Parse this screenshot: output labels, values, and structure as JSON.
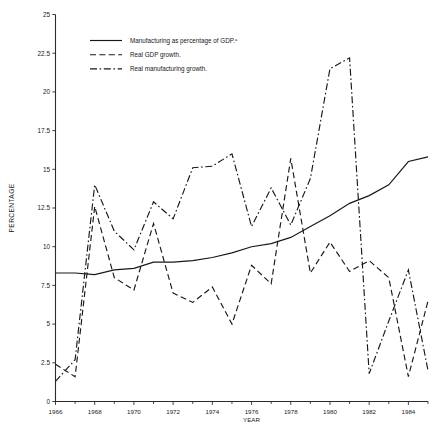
{
  "chart_data": {
    "type": "line",
    "title": "",
    "xlabel": "YEAR",
    "ylabel": "PERCENTAGE",
    "xlim": [
      1966,
      1985
    ],
    "ylim": [
      0,
      25
    ],
    "ytick_labels": [
      "0",
      "2.5",
      "5",
      "7.5",
      "10",
      "12.5",
      "15",
      "17.5",
      "20",
      "22.5",
      "25"
    ],
    "ytick_values": [
      0,
      2.5,
      5,
      7.5,
      10,
      12.5,
      15,
      17.5,
      20,
      22.5,
      25
    ],
    "xtick_labels": [
      "1966",
      "1968",
      "1970",
      "1972",
      "1974",
      "1976",
      "1978",
      "1980",
      "1982",
      "1984"
    ],
    "xtick_values": [
      1966,
      1968,
      1970,
      1972,
      1974,
      1976,
      1978,
      1980,
      1982,
      1984
    ],
    "x_minor_ticks": [
      1967,
      1969,
      1971,
      1973,
      1975,
      1977,
      1979,
      1981,
      1983,
      1985
    ],
    "grid": false,
    "legend_position": "top-center",
    "x": [
      1966,
      1967,
      1968,
      1969,
      1970,
      1971,
      1972,
      1973,
      1974,
      1975,
      1976,
      1977,
      1978,
      1979,
      1980,
      1981,
      1982,
      1983,
      1984,
      1985
    ],
    "series": [
      {
        "name": "Manufacturing as percentage of GDP.",
        "footnote_marker": "a",
        "style": "solid",
        "values": [
          8.3,
          8.3,
          8.2,
          8.5,
          8.6,
          9.0,
          9.0,
          9.1,
          9.3,
          9.6,
          10.0,
          10.2,
          10.6,
          11.3,
          12.0,
          12.8,
          13.3,
          14.0,
          15.5,
          15.8
        ]
      },
      {
        "name": "Real GDP growth.",
        "style": "dashed",
        "values": [
          2.4,
          1.6,
          12.6,
          8.0,
          7.2,
          11.5,
          7.0,
          6.4,
          7.4,
          5.0,
          8.8,
          7.6,
          15.7,
          8.3,
          10.3,
          8.4,
          9.1,
          8.0,
          1.6,
          6.5
        ]
      },
      {
        "name": "Real manufacturing growth.",
        "style": "dashdot",
        "values": [
          1.3,
          2.7,
          14.0,
          11.0,
          9.8,
          12.9,
          11.8,
          15.1,
          15.2,
          16.0,
          11.3,
          13.8,
          11.4,
          14.4,
          21.5,
          22.2,
          1.8,
          5.2,
          8.5,
          2.0
        ]
      }
    ],
    "legend": [
      {
        "label": "Manufacturing as percentage of GDP.",
        "sup": "a",
        "style": "solid"
      },
      {
        "label": "Real GDP growth.",
        "sup": "",
        "style": "dashed"
      },
      {
        "label": "Real manufacturing growth.",
        "sup": "",
        "style": "dashdot"
      }
    ]
  }
}
